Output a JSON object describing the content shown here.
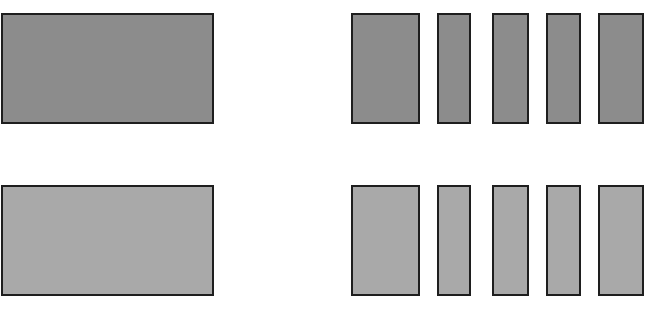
{
  "diagram": {
    "colors": {
      "background": "#ffffff",
      "outline": "#1e1e1e",
      "dark_fill": "#8c8c8c",
      "light_fill": "#a9a9a9"
    },
    "rows": [
      {
        "name": "dark-row",
        "fill": "#8c8c8c",
        "top": 13,
        "height": 111,
        "big_block": {
          "left": 1,
          "width": 213
        },
        "bars": [
          {
            "left": 351,
            "width": 69
          },
          {
            "left": 437,
            "width": 34
          },
          {
            "left": 492,
            "width": 37
          },
          {
            "left": 546,
            "width": 35
          },
          {
            "left": 598,
            "width": 46
          }
        ]
      },
      {
        "name": "light-row",
        "fill": "#a9a9a9",
        "top": 185,
        "height": 111,
        "big_block": {
          "left": 1,
          "width": 213
        },
        "bars": [
          {
            "left": 351,
            "width": 69
          },
          {
            "left": 437,
            "width": 34
          },
          {
            "left": 492,
            "width": 37
          },
          {
            "left": 546,
            "width": 35
          },
          {
            "left": 598,
            "width": 46
          }
        ]
      }
    ]
  }
}
